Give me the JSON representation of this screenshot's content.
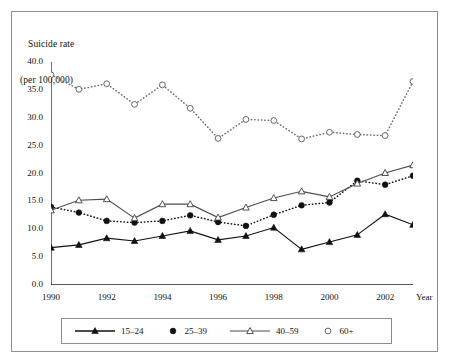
{
  "figure": {
    "axis_title_line1": "Suicide rate",
    "axis_title_line2": "(per 100,000)",
    "x_axis_name": "Year",
    "frame_color": "#8d8d8d",
    "background": "#ffffff",
    "ink_color": "#111111"
  },
  "chart_data": {
    "type": "line",
    "title": "Suicide rate (per 100,000)",
    "xlabel": "Year",
    "ylabel": "Suicide rate (per 100,000)",
    "x": [
      1990,
      1991,
      1992,
      1993,
      1994,
      1995,
      1996,
      1997,
      1998,
      1999,
      2000,
      2001,
      2002,
      2003
    ],
    "xlim": [
      1990,
      2003
    ],
    "ylim": [
      0.0,
      40.0
    ],
    "ytick_labels": [
      "40.0",
      "35.0",
      "30.0",
      "25.0",
      "20.0",
      "15.0",
      "10.0",
      "5.0",
      "0.0"
    ],
    "ytick_values": [
      40.0,
      35.0,
      30.0,
      25.0,
      20.0,
      15.0,
      10.0,
      5.0,
      0.0
    ],
    "xtick_labels": [
      "1990",
      "1992",
      "1994",
      "1996",
      "1998",
      "2000",
      "2002"
    ],
    "xtick_values": [
      1990,
      1992,
      1994,
      1996,
      1998,
      2000,
      2002
    ],
    "grid": false,
    "legend_position": "bottom",
    "series": [
      {
        "name": "15-24",
        "label": "15–24",
        "marker": "filled-triangle",
        "line_style": "solid",
        "color": "#111111",
        "values": [
          6.7,
          7.2,
          8.4,
          7.9,
          8.8,
          9.7,
          8.1,
          8.8,
          10.3,
          6.4,
          7.7,
          9.0,
          12.7,
          10.8
        ]
      },
      {
        "name": "25-39",
        "label": "25–39",
        "marker": "filled-circle",
        "line_style": "dotted",
        "color": "#111111",
        "values": [
          14.0,
          13.0,
          11.5,
          11.2,
          11.5,
          12.5,
          11.3,
          10.6,
          12.6,
          14.3,
          14.8,
          18.7,
          18.0,
          19.6
        ]
      },
      {
        "name": "40-59",
        "label": "40–59",
        "marker": "open-triangle",
        "line_style": "solid",
        "color": "#4d4d4d",
        "values": [
          13.4,
          15.2,
          15.4,
          12.0,
          14.5,
          14.5,
          12.1,
          13.9,
          15.6,
          16.8,
          15.8,
          18.2,
          20.1,
          21.5
        ]
      },
      {
        "name": "60+",
        "label": "60+",
        "marker": "open-circle",
        "line_style": "dotted",
        "color": "#6b6b6b",
        "values": [
          37.7,
          35.1,
          36.1,
          32.4,
          35.9,
          31.7,
          26.3,
          29.7,
          29.5,
          26.2,
          27.4,
          27.0,
          26.8,
          36.5
        ]
      }
    ]
  },
  "legend": {
    "entries": [
      {
        "label": "15–24",
        "marker": "filled-triangle",
        "line_style": "solid"
      },
      {
        "label": "25–39",
        "marker": "filled-circle",
        "line_style": "none"
      },
      {
        "label": "40–59",
        "marker": "open-triangle",
        "line_style": "solid"
      },
      {
        "label": "60+",
        "marker": "open-circle",
        "line_style": "none"
      }
    ]
  }
}
